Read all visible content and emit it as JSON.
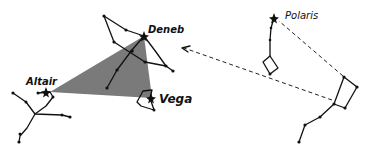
{
  "diagram": {
    "colors": {
      "triangle_fill": "#7a7a7a",
      "lines": "#111111",
      "background": "#ffffff"
    },
    "stars": [
      {
        "name": "Deneb",
        "label": "Deneb",
        "x": 144,
        "y": 36
      },
      {
        "name": "Altair",
        "label": "Altair",
        "x": 45,
        "y": 92
      },
      {
        "name": "Vega",
        "label": "Vega",
        "x": 150,
        "y": 98
      },
      {
        "name": "Polaris",
        "label": "Polaris",
        "x": 274,
        "y": 18
      }
    ],
    "triangle": {
      "points": [
        [
          50,
          92
        ],
        [
          144,
          36
        ],
        [
          152,
          98
        ]
      ]
    },
    "pointer_lines": [
      {
        "from": [
          343,
          78
        ],
        "to": [
          182,
          48
        ],
        "arrow": true
      },
      {
        "from": [
          344,
          77
        ],
        "to": [
          278,
          20
        ],
        "arrow": false
      }
    ]
  }
}
